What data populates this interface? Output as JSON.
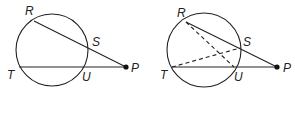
{
  "figures": [
    {
      "id": "left",
      "description": "Circle with secants PR and PT from external point P",
      "labels": {
        "R": "R",
        "S": "S",
        "T": "T",
        "U": "U",
        "P": "P"
      },
      "segments": [
        {
          "from": "R",
          "to": "P",
          "style": "solid"
        },
        {
          "from": "T",
          "to": "P",
          "style": "solid"
        }
      ]
    },
    {
      "id": "right",
      "description": "Same circle with secants plus dashed chords RU and TS",
      "labels": {
        "R": "R",
        "S": "S",
        "T": "T",
        "U": "U",
        "P": "P"
      },
      "segments": [
        {
          "from": "R",
          "to": "P",
          "style": "solid"
        },
        {
          "from": "T",
          "to": "P",
          "style": "solid"
        },
        {
          "from": "R",
          "to": "U",
          "style": "dashed"
        },
        {
          "from": "T",
          "to": "S",
          "style": "dashed"
        }
      ]
    }
  ],
  "colors": {
    "ink": "#222222",
    "background": "#ffffff"
  }
}
